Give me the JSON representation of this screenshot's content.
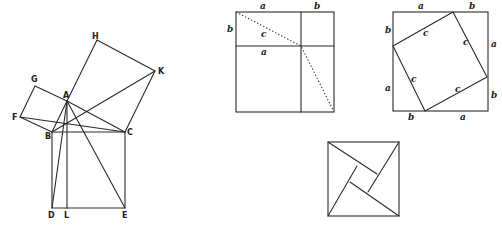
{
  "figures": {
    "euclid": {
      "labels": {
        "H": "H",
        "K": "K",
        "G": "G",
        "A": "A",
        "F": "F",
        "B": "B",
        "C": "C",
        "D": "D",
        "L": "L",
        "E": "E"
      }
    },
    "grid_square": {
      "labels": {
        "top_a": "a",
        "top_b": "b",
        "left_b": "b",
        "diag_c": "c",
        "mid_a": "a"
      }
    },
    "tilted_square": {
      "labels": {
        "top_a": "a",
        "top_b": "b",
        "left_b": "b",
        "left_a": "a",
        "right_a": "a",
        "right_b": "b",
        "bottom_b": "b",
        "bottom_a": "a",
        "side_c1": "c",
        "side_c2": "c",
        "side_c3": "c",
        "side_c4": "c"
      }
    },
    "pinwheel": {}
  },
  "colors": {
    "stroke": "#2a2a2a",
    "background": "#ffffff"
  }
}
